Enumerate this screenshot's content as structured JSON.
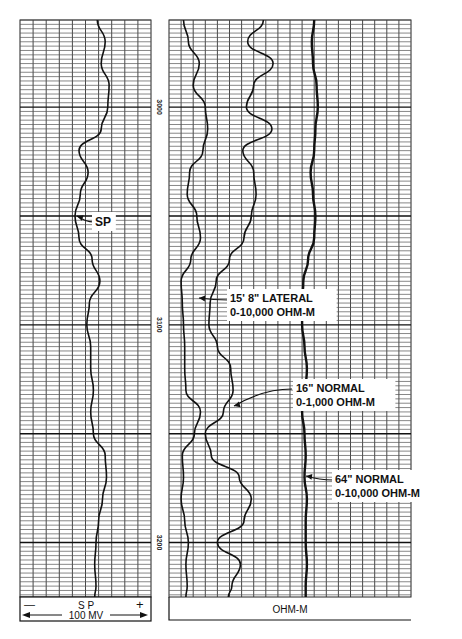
{
  "chart_data": {
    "type": "line",
    "depth_axis": {
      "label": "Depth",
      "ticks": [
        "3000",
        "3100",
        "3200"
      ],
      "range": [
        2960,
        3225
      ]
    },
    "tracks": [
      {
        "name": "SP track",
        "footer": {
          "minus": "—",
          "plus": "+",
          "title": "S P",
          "scale": "100 MV"
        },
        "divisions": 10,
        "curves": [
          {
            "name": "SP",
            "label": "SP",
            "unit": "MV",
            "scale_divisions_range": [
              0,
              10
            ],
            "depths": [
              2960,
              2970,
              2980,
              2990,
              3000,
              3010,
              3020,
              3030,
              3040,
              3050,
              3060,
              3070,
              3080,
              3090,
              3100,
              3110,
              3120,
              3130,
              3140,
              3150,
              3160,
              3170,
              3180,
              3190,
              3200,
              3210,
              3220,
              3225
            ],
            "values": [
              5.9,
              6.5,
              6.2,
              6.8,
              6.7,
              6.2,
              4.5,
              5.2,
              4.6,
              4.2,
              4.5,
              5.5,
              6.1,
              5.3,
              5.1,
              5.4,
              5.4,
              5.6,
              5.4,
              5.6,
              6.5,
              6.6,
              6.3,
              6.0,
              5.8,
              5.7,
              5.8,
              5.7
            ]
          }
        ]
      },
      {
        "name": "Resistivity track",
        "footer": {
          "title": "OHM-M"
        },
        "divisions": 20,
        "curves": [
          {
            "name": "15' 8\" Lateral",
            "label_line1": "15' 8\" LATERAL",
            "label_line2": "0-10,000 OHM-M",
            "scale_divisions_range": [
              0,
              20
            ],
            "depths": [
              2960,
              2970,
              2980,
              2990,
              3000,
              3010,
              3020,
              3030,
              3040,
              3050,
              3060,
              3070,
              3080,
              3090,
              3100,
              3110,
              3120,
              3130,
              3140,
              3150,
              3160,
              3170,
              3180,
              3190,
              3200,
              3210,
              3220,
              3225
            ],
            "values": [
              1.2,
              1.6,
              2.5,
              2.0,
              3.0,
              3.2,
              2.8,
              1.7,
              1.5,
              2.3,
              2.6,
              1.8,
              1.0,
              1.1,
              1.2,
              1.3,
              1.3,
              1.4,
              2.6,
              2.1,
              1.1,
              1.2,
              1.0,
              1.3,
              1.6,
              1.4,
              1.5,
              1.4
            ]
          },
          {
            "name": "16\" Normal",
            "label_line1": "16\" NORMAL",
            "label_line2": "0-1,000 OHM-M",
            "scale_divisions_range": [
              0,
              20
            ],
            "depths": [
              2960,
              2970,
              2980,
              2990,
              3000,
              3010,
              3020,
              3030,
              3040,
              3050,
              3060,
              3070,
              3080,
              3090,
              3100,
              3110,
              3120,
              3130,
              3140,
              3150,
              3160,
              3170,
              3180,
              3190,
              3200,
              3210,
              3220,
              3225
            ],
            "values": [
              7.8,
              6.5,
              8.6,
              7.0,
              6.4,
              8.5,
              6.1,
              7.0,
              7.2,
              6.8,
              6.2,
              5.0,
              3.9,
              3.4,
              3.3,
              4.0,
              5.1,
              5.3,
              4.5,
              3.0,
              3.5,
              5.8,
              6.8,
              6.2,
              4.0,
              5.9,
              5.2,
              4.9
            ]
          },
          {
            "name": "64\" Normal",
            "label_line1": "64\" NORMAL",
            "label_line2": "0-10,000 OHM-M",
            "scale_divisions_range": [
              0,
              20
            ],
            "depths": [
              2960,
              2970,
              2980,
              2990,
              3000,
              3010,
              3020,
              3030,
              3040,
              3050,
              3060,
              3070,
              3080,
              3090,
              3100,
              3110,
              3120,
              3130,
              3140,
              3150,
              3160,
              3170,
              3180,
              3190,
              3200,
              3210,
              3220,
              3225
            ],
            "values": [
              12.0,
              11.8,
              11.9,
              12.2,
              12.3,
              12.1,
              12.0,
              11.7,
              11.9,
              12.1,
              12.0,
              11.5,
              11.1,
              11.0,
              11.0,
              11.2,
              11.4,
              11.3,
              11.0,
              11.2,
              11.3,
              11.2,
              11.4,
              11.3,
              11.3,
              11.4,
              11.3,
              11.3
            ]
          }
        ]
      }
    ]
  },
  "colors": {
    "ink": "#111111",
    "grid": "#333333",
    "paper": "#ffffff"
  }
}
